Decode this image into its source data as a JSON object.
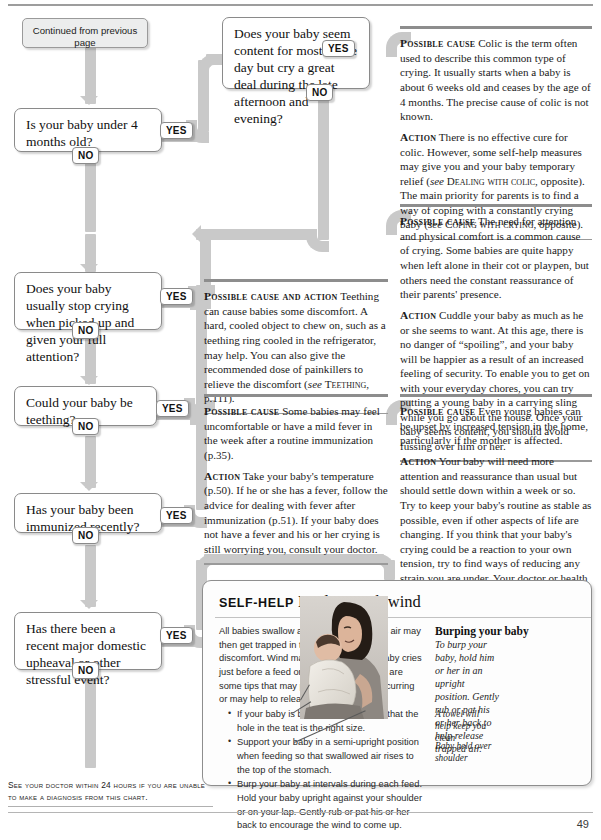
{
  "page": {
    "folio": "49",
    "footnote": "See your doctor within 24 hours if you are unable to make a diagnosis from this chart."
  },
  "flowchart": {
    "start": {
      "label": "Continued from previous page"
    },
    "yes_label": "YES",
    "no_label": "NO",
    "questions": [
      {
        "id": "q1",
        "text": "Is your baby under 4 months old?"
      },
      {
        "id": "q2",
        "text": "Does your baby seem content for most of the day but cry a great deal during the late afternoon and evening?"
      },
      {
        "id": "q3",
        "text": "Does your baby usually stop crying when picked up and given your full attention?"
      },
      {
        "id": "q4",
        "text": "Could your baby be teething?"
      },
      {
        "id": "q5",
        "text": "Has your baby been immunized recently?"
      },
      {
        "id": "q6",
        "text": "Has there been a recent major domestic upheaval or other stressful event?"
      }
    ]
  },
  "advice": {
    "colic": {
      "cause_label": "Possible cause",
      "cause_text": "Colic is the term often used to describe this common type of crying. It usually starts when a baby is about 6 weeks old and ceases by the age of 4 months. The precise cause of colic is not known.",
      "action_label": "Action",
      "action_text_1": "There is no effective cure for colic. However, some self-help measures may give you and your baby temporary relief (",
      "action_ref_1_italic": "see",
      "action_ref_1": "Dealing with colic",
      "action_text_2": ", opposite). The main priority for parents is to find a way of coping with a constantly crying baby (",
      "action_ref_2_italic": "see",
      "action_ref_2": "Coping with crying",
      "action_text_3": ", opposite)."
    },
    "attention": {
      "cause_label": "Possible cause",
      "cause_text": "The need for attention and physical comfort is a common cause of crying. Some babies are quite happy when left alone in their cot or playpen, but others need the constant reassurance of their parents' presence.",
      "action_label": "Action",
      "action_text": "Cuddle your baby as much as he or she seems to want. At this age, there is no danger of “spoiling”, and your baby will be happier as a result of an increased feeling of security. To enable you to get on with your everyday chores, you can try putting a young baby in a carrying sling while you go about the house. Once your baby seems content, you should avoid fussing over him or her."
    },
    "teething": {
      "cause_label": "Possible cause and action",
      "cause_text_1": "Teething can cause babies some discomfort. A hard, cooled object to chew on, such as a teething ring cooled in the refrigerator, may help. You can also give the recommended dose of painkillers to relieve the discomfort (",
      "ref_italic": "see",
      "ref": "Teething",
      "cause_text_2": ", p.111)."
    },
    "immunization": {
      "cause_label": "Possible cause",
      "cause_text": "Some babies may feel uncomfortable or have a mild fever in the week after a routine immunization (p.35).",
      "action_label": "Action",
      "action_text": "Take your baby's temperature (p.50). If he or she has a fever, follow the advice for dealing with fever after immunization (p.51). If your baby does not have a fever and his or her crying is still worrying you, consult your doctor."
    },
    "tension": {
      "cause_label": "Possible cause",
      "cause_text": "Even young babies can be upset by increased tension in the home, particularly if the mother is affected.",
      "action_label": "Action",
      "action_text": "Your baby will need more attention and reassurance than usual but should settle down within a week or so. Try to keep your baby's routine as stable as possible, even if other aspects of life are changing. If you think that your baby's crying could be a reaction to your own tension, try to find ways of reducing any strain you are under. Your doctor or health visitor may be able to suggest ways of helping."
    }
  },
  "selfhelp": {
    "kicker": "Self-help",
    "title": "Dealing with wind",
    "intro": "All babies swallow air when feeding. This air may then get trapped in the intestine, causing discomfort. Wind may be worse if your baby cries just before a feed or feeds greedily. Here are some tips that may prevent wind from occurring or may help to release the wind:",
    "tips": [
      "If your baby is bottle-fed, make sure that the hole in the teat is the right size.",
      "Support your baby in a semi-upright position when feeding so that swallowed air rises to the top of the stomach.",
      "Burp your baby at intervals during each feed. Hold your baby upright against your shoulder or on your lap. Gently rub or pat his or her back to encourage the wind to come up."
    ],
    "figure_heading": "Burping your baby",
    "figure_caption": "To burp your baby, hold him or her in an upright position. Gently rub or pat his or her back to help release trapped air.",
    "label_towel": "A towel will help keep you clean",
    "label_shoulder": "Baby held over shoulder"
  }
}
